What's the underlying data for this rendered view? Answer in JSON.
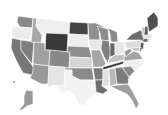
{
  "map": {
    "type": "choropleth",
    "region": "United States",
    "palette": "grayscale",
    "states": [
      {
        "id": "WA",
        "fill": "#8a8a8a",
        "points": "18,16 33,18 32,28 20,27 17,22"
      },
      {
        "id": "OR",
        "fill": "#ebebeb",
        "points": "13,27 32,28 30,40 12,38 12,32"
      },
      {
        "id": "CA",
        "fill": "#777777",
        "points": "12,38 21,40 21,50 34,68 32,75 23,73 16,60 11,48"
      },
      {
        "id": "NV",
        "fill": "#7d7d7d",
        "points": "21,40 34,42 32,64 21,50"
      },
      {
        "id": "ID",
        "fill": "#a8a8a8",
        "points": "33,18 37,18 36,26 42,35 41,44 31,42 32,32"
      },
      {
        "id": "MT",
        "fill": "#eeeeee",
        "points": "37,18 70,22 68,34 46,33 42,35 36,26"
      },
      {
        "id": "WY",
        "fill": "#3a3a3a",
        "points": "46,33 68,34 67,52 45,50"
      },
      {
        "id": "UT",
        "fill": "#a0a0a0",
        "points": "34,42 45,43 45,50 50,50 49,66 33,64"
      },
      {
        "id": "AZ",
        "fill": "#999999",
        "points": "33,64 49,66 48,84 41,84 30,78 33,72"
      },
      {
        "id": "CO",
        "fill": "#888888",
        "points": "50,50 70,52 69,68 49,66"
      },
      {
        "id": "NM",
        "fill": "#e4e4e4",
        "points": "49,66 65,67 64,86 52,85 48,88 48,84"
      },
      {
        "id": "ND",
        "fill": "#444444",
        "points": "70,22 88,23 88,35 69,34"
      },
      {
        "id": "SD",
        "fill": "#ededed",
        "points": "69,34 88,35 89,47 68,46"
      },
      {
        "id": "NE",
        "fill": "#8e8e8e",
        "points": "68,46 89,47 92,58 70,57 70,52 67,52"
      },
      {
        "id": "KS",
        "fill": "#d5d5d5",
        "points": "70,57 92,58 92,68 69,68"
      },
      {
        "id": "OK",
        "fill": "#8a8a8a",
        "points": "65,68 92,68 94,80 80,80 72,76 72,70 65,70"
      },
      {
        "id": "TX",
        "fill": "#f2f2f2",
        "points": "65,70 72,70 72,76 80,80 94,80 99,84 98,92 89,98 84,106 78,103 74,94 68,91 62,93 56,86 64,86"
      },
      {
        "id": "MN",
        "fill": "#909090",
        "points": "88,23 96,23 104,27 99,33 100,40 89,40"
      },
      {
        "id": "IA",
        "fill": "#e6e6e6",
        "points": "89,40 101,40 104,46 100,50 90,49"
      },
      {
        "id": "MO",
        "fill": "#a6a6a6",
        "points": "91,50 100,50 103,57 106,64 102,67 93,67 92,58"
      },
      {
        "id": "AR",
        "fill": "#7a7a7a",
        "points": "93,68 103,68 103,80 95,80"
      },
      {
        "id": "LA",
        "fill": "#6e6e6e",
        "points": "95,80 103,80 102,86 108,90 103,94 96,92"
      },
      {
        "id": "WI",
        "fill": "#8c8c8c",
        "points": "97,26 108,29 109,41 101,40 100,33"
      },
      {
        "id": "IL",
        "fill": "#808080",
        "points": "102,40 109,41 111,53 108,63 104,57 101,49"
      },
      {
        "id": "MI",
        "fill": "#8a8a8a",
        "points": "108,28 117,32 118,42 111,42 110,34"
      },
      {
        "id": "IN",
        "fill": "#6a6a6a",
        "points": "110,43 115,43 115,55 110,57"
      },
      {
        "id": "OH",
        "fill": "#e8e8e8",
        "points": "115,42 124,42 125,52 118,55 115,53"
      },
      {
        "id": "KY",
        "fill": "#c2c2c2",
        "points": "108,60 115,55 120,55 125,54 124,60 109,63"
      },
      {
        "id": "TN",
        "fill": "#3c3c3c",
        "points": "103,67 124,61 126,63 103,70"
      },
      {
        "id": "MS",
        "fill": "#e0e0e0",
        "points": "103,70 109,69 109,86 102,86 103,80"
      },
      {
        "id": "AL",
        "fill": "#b8b8b8",
        "points": "109,69 115,68 117,84 110,86"
      },
      {
        "id": "GA",
        "fill": "#7c7c7c",
        "points": "115,68 122,67 129,77 128,84 117,84"
      },
      {
        "id": "FL",
        "fill": "#9e9e9e",
        "points": "110,86 128,84 133,92 139,104 136,109 132,100 127,94 118,90"
      },
      {
        "id": "SC",
        "fill": "#8a8a8a",
        "points": "122,67 131,66 135,71 129,77"
      },
      {
        "id": "NC",
        "fill": "#f0f0f0",
        "points": "124,61 143,59 143,64 135,71 131,66 122,67"
      },
      {
        "id": "VA",
        "fill": "#a4a4a4",
        "points": "124,57 134,51 139,53 143,59 124,61"
      },
      {
        "id": "WV",
        "fill": "#9a9a9a",
        "points": "124,52 130,48 132,51 126,57"
      },
      {
        "id": "PA",
        "fill": "#dcdcdc",
        "points": "124,42 141,40 142,47 127,49"
      },
      {
        "id": "NY",
        "fill": "#6e6e6e",
        "points": "126,40 132,34 141,30 145,37 143,42 141,40"
      },
      {
        "id": "NJ",
        "fill": "#545454",
        "points": "141,42 144,43 143,50 140,48"
      },
      {
        "id": "MD",
        "fill": "#c8c8c8",
        "points": "130,48 140,47 140,51 134,51"
      },
      {
        "id": "DE",
        "fill": "#555555",
        "points": "140,47 142,48 141,52 140,51"
      },
      {
        "id": "CT",
        "fill": "#6a6a6a",
        "points": "143,39 148,38 148,42 143,42"
      },
      {
        "id": "RI",
        "fill": "#cfcfcf",
        "points": "148,38 150,38 150,41 148,41"
      },
      {
        "id": "MA",
        "fill": "#e2e2e2",
        "points": "143,35 151,34 152,38 143,38"
      },
      {
        "id": "VT",
        "fill": "#c4c4c4",
        "points": "142,27 145,27 144,35 142,35"
      },
      {
        "id": "NH",
        "fill": "#5c5c5c",
        "points": "145,26 148,27 148,35 144,35"
      },
      {
        "id": "ME",
        "fill": "#505050",
        "points": "147,18 154,12 158,18 158,26 149,32 148,27"
      },
      {
        "id": "AK",
        "fill": "#9a9a9a",
        "points": "26,90 33,91 33,104 27,106 22,110 19,110 24,104 24,96"
      },
      {
        "id": "HI",
        "fill": "#6e6e6e",
        "points": "13,81 15,81 15,83 13,83"
      }
    ]
  }
}
